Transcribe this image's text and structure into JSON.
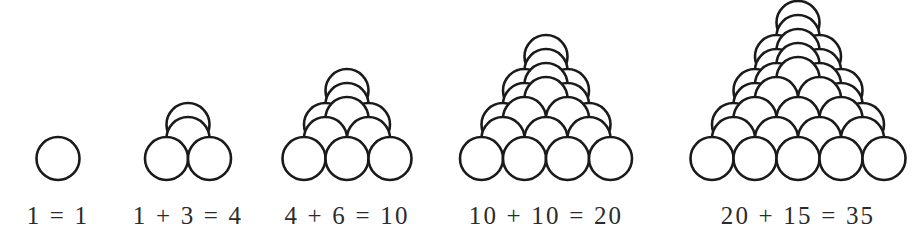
{
  "figure": {
    "background_color": "#ffffff",
    "sphere_fill": "#ffffff",
    "sphere_stroke": "#1a1a1a",
    "caption_color": "#2b2b2b"
  },
  "chart_data": {
    "type": "diagram",
    "categories": [
      "1",
      "4",
      "10",
      "20",
      "35"
    ],
    "values": [
      1,
      4,
      10,
      20,
      35
    ],
    "xlabel": "",
    "ylabel": "",
    "series": [
      {
        "name": "previous tetrahedral number",
        "values": [
          0,
          1,
          4,
          10,
          20
        ]
      },
      {
        "name": "added triangular layer",
        "values": [
          1,
          3,
          6,
          10,
          15
        ]
      },
      {
        "name": "new tetrahedral number",
        "values": [
          1,
          4,
          10,
          20,
          35
        ]
      }
    ],
    "annotations": [
      "1 = 1",
      "1 + 3 = 4",
      "4 + 6 = 10",
      "10 + 10 = 20",
      "20 + 15 = 35"
    ]
  },
  "piles": [
    {
      "name": "pile-1",
      "caption": "1 = 1",
      "layers": 1,
      "sphere_count": 1,
      "base_row_count": 1,
      "center_x": 58,
      "caption_x": 58,
      "caption_y": 203,
      "bottom_y": 180,
      "radius": 21.5
    },
    {
      "name": "pile-2",
      "caption": "1 + 3 = 4",
      "layers": 2,
      "sphere_count": 4,
      "base_row_count": 2,
      "center_x": 188,
      "caption_x": 188,
      "caption_y": 203,
      "bottom_y": 180,
      "radius": 21.5
    },
    {
      "name": "pile-3",
      "caption": "4 + 6 = 10",
      "layers": 3,
      "sphere_count": 10,
      "base_row_count": 3,
      "center_x": 347,
      "caption_x": 347,
      "caption_y": 203,
      "bottom_y": 180,
      "radius": 21.5
    },
    {
      "name": "pile-4",
      "caption": "10 + 10 = 20",
      "layers": 4,
      "sphere_count": 20,
      "base_row_count": 4,
      "center_x": 546,
      "caption_x": 546,
      "caption_y": 203,
      "bottom_y": 180,
      "radius": 21.5
    },
    {
      "name": "pile-5",
      "caption": "20 + 15 = 35",
      "layers": 5,
      "sphere_count": 35,
      "base_row_count": 5,
      "center_x": 798,
      "caption_x": 798,
      "caption_y": 203,
      "bottom_y": 180,
      "radius": 21.5
    }
  ],
  "geometry": {
    "row_dx": 21.5,
    "row_dy": -20.0,
    "layer_dx": 0,
    "layer_dy": -26.0,
    "layer_back_dy": -8.0
  }
}
